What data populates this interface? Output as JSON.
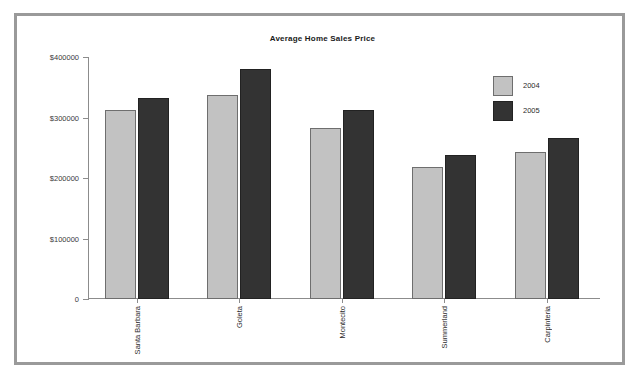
{
  "chart_data": {
    "type": "bar",
    "title": "Average Home Sales Price",
    "xlabel": "",
    "ylabel": "",
    "categories": [
      "Santa Barbara",
      "Goleta",
      "Montecito",
      "Summerland",
      "Carpinteria"
    ],
    "series": [
      {
        "name": "2004",
        "color": "#c2c2c2",
        "values": [
          312000,
          337000,
          282000,
          218000,
          243000
        ]
      },
      {
        "name": "2005",
        "color": "#333333",
        "values": [
          332000,
          380000,
          312000,
          238000,
          266000
        ]
      }
    ],
    "ylim": [
      0,
      400000
    ],
    "ytick_values": [
      400000,
      300000,
      200000,
      100000,
      0
    ],
    "ytick_labels": [
      "$400000",
      "$300000",
      "$200000",
      "$100000",
      "0"
    ],
    "grid": false,
    "legend_position": "top-right",
    "legend_entries": [
      "2004",
      "2005"
    ]
  },
  "frame": {
    "border_color": "#9a9a9a",
    "background": "#ffffff"
  }
}
